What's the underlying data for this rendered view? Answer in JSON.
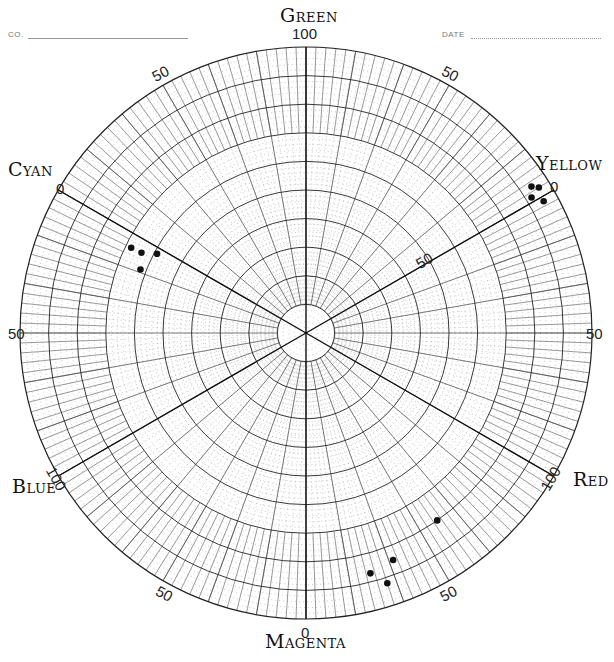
{
  "header": {
    "company_label": "CO.",
    "date_label": "DATE"
  },
  "axes": {
    "green": "GREEN",
    "yellow": "YELLOW",
    "red": "RED",
    "magenta": "MAGENTA",
    "blue": "BLUE",
    "cyan": "CYAN"
  },
  "rim_labels": {
    "top": "100",
    "upper_left": "50",
    "upper_right": "50",
    "cyan_zero": "0",
    "yellow_zero": "0",
    "yellow_inner_50": "50",
    "left": "50",
    "right": "50",
    "blue_100": "100",
    "red_100": "100",
    "lower_left": "50",
    "lower_right": "50",
    "magenta_zero": "0"
  },
  "colors": {
    "ink": "#111111",
    "grid_major": "#222222",
    "grid_minor": "#8a8a8a",
    "background": "#ffffff"
  },
  "chart_data": {
    "type": "scatter",
    "subtype": "polar",
    "angular_axis": {
      "primaries": [
        {
          "name": "Yellow",
          "angle_deg": 30,
          "rim_label": "0"
        },
        {
          "name": "Green",
          "angle_deg": 90,
          "rim_label": "100"
        },
        {
          "name": "Cyan",
          "angle_deg": 150,
          "rim_label": "0"
        },
        {
          "name": "Blue",
          "angle_deg": 210,
          "rim_label": "100"
        },
        {
          "name": "Magenta",
          "angle_deg": 270,
          "rim_label": "0"
        },
        {
          "name": "Red",
          "angle_deg": 330,
          "rim_label": "100"
        }
      ],
      "midpoint_labels": [
        {
          "angle_deg": 60,
          "label": "50"
        },
        {
          "angle_deg": 120,
          "label": "50"
        },
        {
          "angle_deg": 180,
          "label": "50"
        },
        {
          "angle_deg": 240,
          "label": "50"
        },
        {
          "angle_deg": 300,
          "label": "50"
        },
        {
          "angle_deg": 0,
          "label": "50"
        }
      ],
      "minor_tick_deg": 2
    },
    "radial_axis": {
      "range": [
        0,
        100
      ],
      "major_rings": [
        10,
        20,
        30,
        40,
        50,
        60,
        70,
        80,
        90,
        100
      ],
      "inner_label": {
        "value": 50,
        "on_axis": "Yellow",
        "label": "50"
      }
    },
    "grid": true,
    "series": [
      {
        "name": "Cyan cluster",
        "points": [
          {
            "angle_deg": 154,
            "r": 68
          },
          {
            "angle_deg": 154,
            "r": 64
          },
          {
            "angle_deg": 152,
            "r": 59
          },
          {
            "angle_deg": 159,
            "r": 62
          }
        ]
      },
      {
        "name": "Yellow cluster",
        "points": [
          {
            "angle_deg": 33,
            "r": 94
          },
          {
            "angle_deg": 32,
            "r": 96
          },
          {
            "angle_deg": 31,
            "r": 92
          },
          {
            "angle_deg": 29,
            "r": 95
          }
        ]
      },
      {
        "name": "Magenta-Red cluster",
        "points": [
          {
            "angle_deg": 305,
            "r": 80
          },
          {
            "angle_deg": 291,
            "r": 85
          },
          {
            "angle_deg": 285,
            "r": 87
          },
          {
            "angle_deg": 288,
            "r": 92
          }
        ]
      }
    ]
  }
}
